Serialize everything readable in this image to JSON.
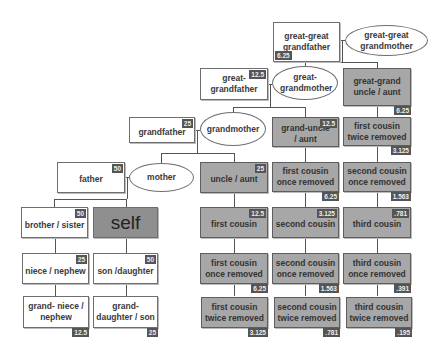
{
  "colors": {
    "blood_relative_box": "#a7a7a7",
    "direct_box": "#ffffff",
    "self_box": "#8f8f8f",
    "badge": "#555555"
  },
  "nodes": {
    "great_great_grandfather": {
      "label": "great-great grandfather",
      "badge": "6.25"
    },
    "great_great_grandmother": {
      "label": "great-great grandmother"
    },
    "great_grandfather": {
      "label": "great-grandfather",
      "badge": "12.5"
    },
    "great_grandmother": {
      "label": "great-grandmother"
    },
    "great_grand_uncle_aunt": {
      "label": "great-grand uncle / aunt",
      "badge": "6.25"
    },
    "grandfather": {
      "label": "grandfather",
      "badge": "25"
    },
    "grandmother": {
      "label": "grandmother"
    },
    "grand_uncle_aunt": {
      "label": "grand-uncle / aunt",
      "badge": "12.5"
    },
    "first_cousin_twice_removed_up": {
      "label": "first cousin twice removed",
      "badge": "3.125"
    },
    "father": {
      "label": "father",
      "badge": "50"
    },
    "mother": {
      "label": "mother"
    },
    "uncle_aunt": {
      "label": "uncle / aunt",
      "badge": "25"
    },
    "first_cousin_once_removed_up": {
      "label": "first cousin once removed",
      "badge": "6.25"
    },
    "second_cousin_once_removed_up": {
      "label": "second cousin once removed",
      "badge": "1.563"
    },
    "brother_sister": {
      "label": "brother / sister",
      "badge": "50"
    },
    "self": {
      "label": "self"
    },
    "first_cousin": {
      "label": "first cousin",
      "badge": "12.5"
    },
    "second_cousin": {
      "label": "second cousin",
      "badge": "3.125"
    },
    "third_cousin": {
      "label": "third cousin",
      "badge": ".781"
    },
    "niece_nephew": {
      "label": "niece / nephew",
      "badge": "25"
    },
    "son_daughter": {
      "label": "son /daughter",
      "badge": "50"
    },
    "first_cousin_once_removed_down": {
      "label": "first cousin once removed",
      "badge": "6.25"
    },
    "second_cousin_once_removed_down": {
      "label": "second cousin once removed",
      "badge": "1.563"
    },
    "third_cousin_once_removed": {
      "label": "third cousin once removed",
      "badge": ".391"
    },
    "grand_niece_nephew": {
      "label": "grand- niece / nephew",
      "badge": "12.5"
    },
    "grand_daughter_son": {
      "label": "grand- daughter / son",
      "badge": "25"
    },
    "first_cousin_twice_removed_down": {
      "label": "first cousin twice removed",
      "badge": "3.125"
    },
    "second_cousin_twice_removed": {
      "label": "second cousin twice removed",
      "badge": ".781"
    },
    "third_cousin_twice_removed": {
      "label": "third cousin twice removed",
      "badge": ".195"
    }
  }
}
